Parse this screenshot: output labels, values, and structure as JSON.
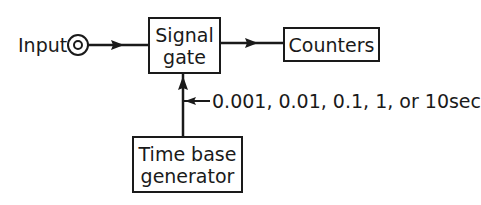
{
  "diagram": {
    "input": {
      "label": "Input",
      "connector_icon": "coaxial-input-jack-icon"
    },
    "signal_gate": {
      "line1": "Signal",
      "line2": "gate"
    },
    "counters": {
      "label": "Counters"
    },
    "time_base": {
      "line1": "Time base",
      "line2": "generator"
    },
    "gate_time_options": {
      "label": "0.001, 0.01, 0.1, 1, or 10sec"
    },
    "edges": [
      {
        "from": "Input",
        "to": "Signal gate"
      },
      {
        "from": "Signal gate",
        "to": "Counters"
      },
      {
        "from": "Time base generator",
        "to": "Signal gate"
      },
      {
        "from": "gate time selection",
        "to": "Time base line"
      }
    ],
    "colors": {
      "ink": "#1a1a1a",
      "background": "#ffffff"
    }
  }
}
